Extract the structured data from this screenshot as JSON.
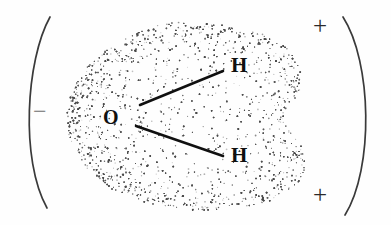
{
  "figure": {
    "background_color": "#fefefe",
    "width": 391,
    "height": 225
  },
  "molecule": {
    "atoms": [
      {
        "id": "oxygen",
        "label": "O",
        "x": 112,
        "y": 118
      },
      {
        "id": "hydrogen-upper",
        "label": "H",
        "x": 240,
        "y": 66
      },
      {
        "id": "hydrogen-lower",
        "label": "H",
        "x": 240,
        "y": 156
      }
    ],
    "bonds": [
      {
        "id": "bond-o-h-upper",
        "from": "oxygen",
        "to": "hydrogen-upper",
        "x1": 140,
        "y1": 105,
        "x2": 223,
        "y2": 71
      },
      {
        "id": "bond-o-h-lower",
        "from": "oxygen",
        "to": "hydrogen-lower",
        "x1": 136,
        "y1": 126,
        "x2": 223,
        "y2": 156
      }
    ],
    "cloud": {
      "name": "electron-cloud",
      "style": "stippled",
      "stipple_color": "#4a4a4a",
      "dot_count": 5200
    }
  },
  "charges": [
    {
      "id": "charge-negative",
      "symbol": "−",
      "side": "left",
      "x": 42,
      "y": 113
    },
    {
      "id": "charge-positive-top",
      "symbol": "+",
      "side": "right",
      "x": 322,
      "y": 27
    },
    {
      "id": "charge-positive-bottom",
      "symbol": "+",
      "side": "right",
      "x": 322,
      "y": 196
    }
  ],
  "field_arcs": [
    {
      "id": "arc-left",
      "side": "left",
      "color": "#3a3a3a"
    },
    {
      "id": "arc-right",
      "side": "right",
      "color": "#3a3a3a"
    }
  ],
  "colors": {
    "ink": "#101010",
    "arc": "#3a3a3a",
    "stipple": "#4a4a4a",
    "paper": "#fefefe"
  }
}
